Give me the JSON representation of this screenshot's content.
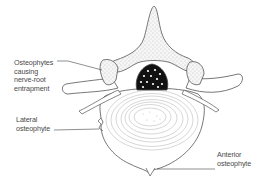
{
  "diagram": {
    "labels": {
      "nerve_root": "Osteophytes causing\nnerve-root\nentrapment",
      "lateral": "Lateral\nosteophyte",
      "anterior": "Anterior\nosteophyte"
    },
    "colors": {
      "line": "#555555",
      "bone_fill": "#f3f3f3",
      "stipple": "#9a9a9a",
      "canal": "#111111",
      "canal_dots": "#ffffff",
      "ring": "#b8b8b8",
      "text": "#4a4a4a"
    }
  }
}
